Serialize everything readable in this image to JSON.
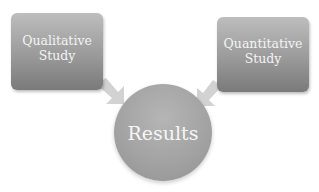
{
  "diagram": {
    "type": "converging-flow",
    "nodes": [
      {
        "id": "qualitative",
        "label": "Qualitative\nStudy",
        "line1": "Qualitative",
        "line2": "Study",
        "shape": "rounded-rectangle"
      },
      {
        "id": "quantitative",
        "label": "Quantitative\nStudy",
        "line1": "Quantitative",
        "line2": "Study",
        "shape": "rounded-rectangle"
      },
      {
        "id": "results",
        "label": "Results",
        "shape": "circle"
      }
    ],
    "edges": [
      {
        "from": "qualitative",
        "to": "results"
      },
      {
        "from": "quantitative",
        "to": "results"
      }
    ],
    "colors": {
      "box_top": "#bdbdbd",
      "box_bottom": "#7a7a7a",
      "circle": "#a3a3a3",
      "arrow": "#cfcfcf",
      "text": "#f4f4f4"
    }
  }
}
